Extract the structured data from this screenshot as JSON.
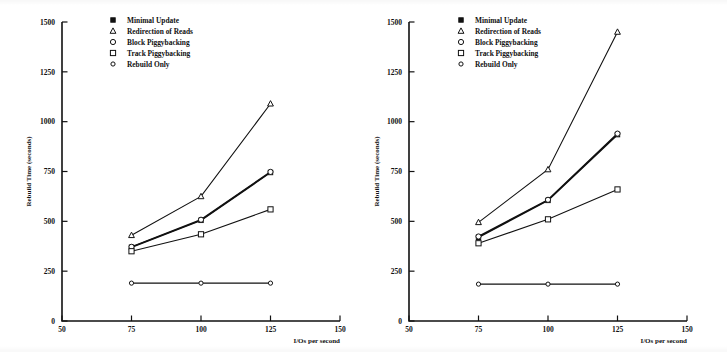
{
  "figure": {
    "panel_count": 2,
    "background_color": "#ffffff",
    "ink_color": "#111111"
  },
  "legend": {
    "entries": [
      {
        "label": "Minimal Update",
        "marker": "filled-square-icon"
      },
      {
        "label": "Redirection of Reads",
        "marker": "triangle-icon"
      },
      {
        "label": "Block Piggybacking",
        "marker": "circle-icon"
      },
      {
        "label": "Track Piggybacking",
        "marker": "square-icon"
      },
      {
        "label": "Rebuild Only",
        "marker": "small-circle-icon"
      }
    ]
  },
  "axes": {
    "x_label": "I/Os per second",
    "y_label": "Rebuild Time (seconds)",
    "x_ticks": [
      "50",
      "75",
      "100",
      "125",
      "150"
    ],
    "y_ticks": [
      "0",
      "250",
      "500",
      "750",
      "1000",
      "1250",
      "1500"
    ]
  },
  "chart_data": [
    {
      "type": "line",
      "panel": "left",
      "title": "",
      "xlabel": "I/Os per second",
      "ylabel": "Rebuild Time (seconds)",
      "xlim": [
        50,
        150
      ],
      "ylim": [
        0,
        1500
      ],
      "xticks": [
        50,
        75,
        100,
        125,
        150
      ],
      "yticks": [
        0,
        250,
        500,
        750,
        1000,
        1250,
        1500
      ],
      "grid": false,
      "legend_position": "top-center",
      "x": [
        75,
        100,
        125
      ],
      "series": [
        {
          "name": "Redirection of Reads",
          "marker": "triangle",
          "values": [
            430,
            625,
            1090
          ]
        },
        {
          "name": "Minimal Update",
          "marker": "filled-square",
          "values": [
            370,
            505,
            745
          ]
        },
        {
          "name": "Block Piggybacking",
          "marker": "circle",
          "values": [
            372,
            508,
            748
          ]
        },
        {
          "name": "Track Piggybacking",
          "marker": "square",
          "values": [
            350,
            435,
            560
          ]
        },
        {
          "name": "Rebuild Only",
          "marker": "small-circle",
          "values": [
            190,
            190,
            190
          ]
        }
      ]
    },
    {
      "type": "line",
      "panel": "right",
      "title": "",
      "xlabel": "I/Os per second",
      "ylabel": "Rebuild Time (seconds)",
      "xlim": [
        50,
        150
      ],
      "ylim": [
        0,
        1500
      ],
      "xticks": [
        50,
        75,
        100,
        125,
        150
      ],
      "yticks": [
        0,
        250,
        500,
        750,
        1000,
        1250,
        1500
      ],
      "grid": false,
      "legend_position": "top-center",
      "x": [
        75,
        100,
        125
      ],
      "series": [
        {
          "name": "Redirection of Reads",
          "marker": "triangle",
          "values": [
            495,
            760,
            1450
          ]
        },
        {
          "name": "Minimal Update",
          "marker": "filled-square",
          "values": [
            420,
            605,
            935
          ]
        },
        {
          "name": "Block Piggybacking",
          "marker": "circle",
          "values": [
            424,
            608,
            940
          ]
        },
        {
          "name": "Track Piggybacking",
          "marker": "square",
          "values": [
            390,
            510,
            660
          ]
        },
        {
          "name": "Rebuild Only",
          "marker": "small-circle",
          "values": [
            185,
            185,
            185
          ]
        }
      ]
    }
  ]
}
